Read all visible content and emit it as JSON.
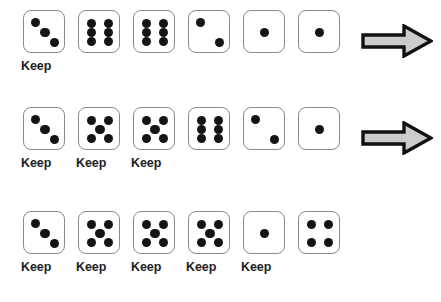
{
  "scene": {
    "title": "Dice keep selection sequence",
    "die_face_color": "#ffffff",
    "die_border_color": "#8a8a8a",
    "pip_color": "#141414",
    "arrow_fill_color": "#cccccc",
    "arrow_outline_color": "#111111",
    "keep_label": "Keep",
    "arrow_icon_name": "right-arrow-icon"
  },
  "rows": [
    {
      "index": 1,
      "dice": [
        {
          "value": 3,
          "keep": true,
          "keep_label": "Keep"
        },
        {
          "value": 6,
          "keep": false,
          "keep_label": ""
        },
        {
          "value": 6,
          "keep": false,
          "keep_label": ""
        },
        {
          "value": 2,
          "keep": false,
          "keep_label": ""
        },
        {
          "value": 1,
          "keep": false,
          "keep_label": ""
        },
        {
          "value": 1,
          "keep": false,
          "keep_label": ""
        }
      ],
      "has_arrow": true
    },
    {
      "index": 2,
      "dice": [
        {
          "value": 3,
          "keep": true,
          "keep_label": "Keep"
        },
        {
          "value": 5,
          "keep": true,
          "keep_label": "Keep"
        },
        {
          "value": 5,
          "keep": true,
          "keep_label": "Keep"
        },
        {
          "value": 6,
          "keep": false,
          "keep_label": ""
        },
        {
          "value": 2,
          "keep": false,
          "keep_label": ""
        },
        {
          "value": 1,
          "keep": false,
          "keep_label": ""
        }
      ],
      "has_arrow": true
    },
    {
      "index": 3,
      "dice": [
        {
          "value": 3,
          "keep": true,
          "keep_label": "Keep"
        },
        {
          "value": 5,
          "keep": true,
          "keep_label": "Keep"
        },
        {
          "value": 5,
          "keep": true,
          "keep_label": "Keep"
        },
        {
          "value": 5,
          "keep": true,
          "keep_label": "Keep"
        },
        {
          "value": 1,
          "keep": true,
          "keep_label": "Keep"
        },
        {
          "value": 4,
          "keep": false,
          "keep_label": ""
        }
      ],
      "has_arrow": false
    }
  ],
  "layout": {
    "die_pitch_px": 55,
    "first_die_left_px": 23
  }
}
